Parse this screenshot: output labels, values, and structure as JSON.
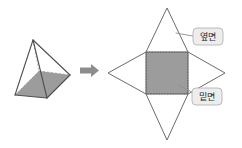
{
  "figure": {
    "colors": {
      "stroke": "#5a5a5a",
      "shade_fill": "#9c9c9c",
      "hidden_edge": "#9a9a9a",
      "label_box_fill": "#ededed",
      "label_box_border": "#b4b4b4",
      "label_text": "#2b2b2b",
      "arrow": "#8d8d8d",
      "background": "#ffffff"
    },
    "solid": {
      "name": "square-pyramid",
      "apex": {
        "x": 33,
        "y": 40
      },
      "base_front_left": {
        "x": 15,
        "y": 95
      },
      "base_front_bottom": {
        "x": 47,
        "y": 98
      },
      "base_right": {
        "x": 70,
        "y": 75
      },
      "base_back": {
        "x": 39,
        "y": 71
      },
      "shaded_face": "base"
    },
    "arrow": {
      "name": "transform-arrow",
      "glyph": "→",
      "from_x": 80,
      "to_x": 100,
      "y": 70
    },
    "net": {
      "name": "square-pyramid-net",
      "square": {
        "x": 146,
        "y": 52,
        "width": 42,
        "height": 42
      },
      "triangle_tips": {
        "top": {
          "x": 167,
          "y": 8
        },
        "bottom": {
          "x": 167,
          "y": 140
        },
        "left": {
          "x": 108,
          "y": 73
        },
        "right": {
          "x": 225,
          "y": 73
        }
      },
      "shaded_face": "square-base"
    },
    "labels": [
      {
        "id": "lateral-face",
        "text": "옆면",
        "box": {
          "x": 193,
          "y": 28,
          "width": 30,
          "height": 17
        },
        "leader_from": {
          "x": 193,
          "y": 36
        },
        "leader_to": {
          "x": 176,
          "y": 33
        }
      },
      {
        "id": "base-face",
        "text": "밑면",
        "box": {
          "x": 192,
          "y": 88,
          "width": 30,
          "height": 17
        },
        "leader_from": {
          "x": 192,
          "y": 92
        },
        "leader_to": {
          "x": 178,
          "y": 85
        }
      }
    ]
  }
}
